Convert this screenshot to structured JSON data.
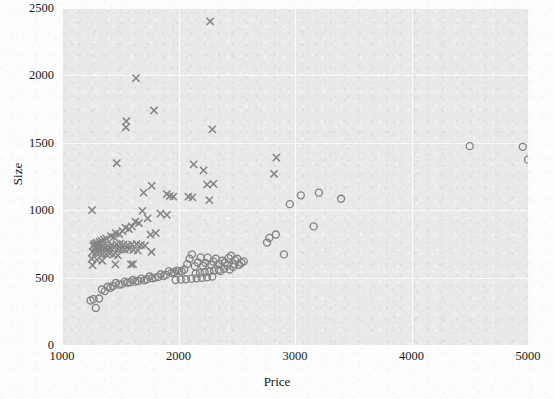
{
  "chart_data": {
    "type": "scatter",
    "title": "",
    "xlabel": "Price",
    "ylabel": "Size",
    "xlim": [
      1000,
      5000
    ],
    "ylim": [
      0,
      2500
    ],
    "xticks": [
      "1000",
      "2000",
      "3000",
      "4000",
      "5000"
    ],
    "yticks": [
      "0",
      "500",
      "1000",
      "1500",
      "2000",
      "2500"
    ],
    "grid": true,
    "legend": "none",
    "background_color": "#e9e9e9",
    "marker_color": "#838383",
    "series": [
      {
        "name": "cross-series",
        "marker": "x",
        "points": [
          [
            2272,
            2400
          ],
          [
            1635,
            1980
          ],
          [
            1790,
            1740
          ],
          [
            1552,
            1660
          ],
          [
            1548,
            1615
          ],
          [
            2290,
            1600
          ],
          [
            1470,
            1350
          ],
          [
            2130,
            1340
          ],
          [
            2215,
            1295
          ],
          [
            2840,
            1390
          ],
          [
            2820,
            1270
          ],
          [
            2300,
            1195
          ],
          [
            2245,
            1190
          ],
          [
            1770,
            1180
          ],
          [
            1700,
            1130
          ],
          [
            1900,
            1120
          ],
          [
            1925,
            1105
          ],
          [
            1955,
            1100
          ],
          [
            2085,
            1100
          ],
          [
            2120,
            1095
          ],
          [
            2265,
            1075
          ],
          [
            1258,
            1000
          ],
          [
            1690,
            995
          ],
          [
            1845,
            975
          ],
          [
            1900,
            965
          ],
          [
            1735,
            940
          ],
          [
            1630,
            915
          ],
          [
            1660,
            905
          ],
          [
            1600,
            880
          ],
          [
            1545,
            870
          ],
          [
            1575,
            860
          ],
          [
            1520,
            845
          ],
          [
            1462,
            830
          ],
          [
            1492,
            822
          ],
          [
            1420,
            808
          ],
          [
            1445,
            800
          ],
          [
            1380,
            790
          ],
          [
            1360,
            782
          ],
          [
            1805,
            830
          ],
          [
            1760,
            818
          ],
          [
            1340,
            772
          ],
          [
            1322,
            765
          ],
          [
            1300,
            758
          ],
          [
            1290,
            752
          ],
          [
            1275,
            748
          ],
          [
            1315,
            742
          ],
          [
            1352,
            738
          ],
          [
            1390,
            735
          ],
          [
            1425,
            742
          ],
          [
            1468,
            748
          ],
          [
            1500,
            752
          ],
          [
            1530,
            745
          ],
          [
            1565,
            740
          ],
          [
            1600,
            745
          ],
          [
            1640,
            748
          ],
          [
            1678,
            742
          ],
          [
            1712,
            738
          ],
          [
            1268,
            735
          ],
          [
            1285,
            728
          ],
          [
            1310,
            722
          ],
          [
            1335,
            718
          ],
          [
            1360,
            715
          ],
          [
            1390,
            712
          ],
          [
            1418,
            718
          ],
          [
            1448,
            722
          ],
          [
            1478,
            715
          ],
          [
            1508,
            710
          ],
          [
            1540,
            706
          ],
          [
            1575,
            712
          ],
          [
            1612,
            706
          ],
          [
            1650,
            700
          ],
          [
            1262,
            690
          ],
          [
            1290,
            685
          ],
          [
            1320,
            680
          ],
          [
            1348,
            676
          ],
          [
            1380,
            672
          ],
          [
            1410,
            678
          ],
          [
            1442,
            670
          ],
          [
            1480,
            665
          ],
          [
            1768,
            690
          ],
          [
            1255,
            640
          ],
          [
            1300,
            632
          ],
          [
            1345,
            625
          ],
          [
            1458,
            598
          ],
          [
            1610,
            600
          ],
          [
            1592,
            598
          ],
          [
            1262,
            592
          ]
        ]
      },
      {
        "name": "circle-series",
        "marker": "o",
        "points": [
          [
            4500,
            1475
          ],
          [
            4955,
            1470
          ],
          [
            5000,
            1375
          ],
          [
            3205,
            1130
          ],
          [
            3395,
            1085
          ],
          [
            3050,
            1110
          ],
          [
            2955,
            1045
          ],
          [
            3160,
            880
          ],
          [
            2905,
            672
          ],
          [
            2780,
            795
          ],
          [
            2835,
            820
          ],
          [
            2760,
            760
          ],
          [
            2485,
            630
          ],
          [
            2505,
            640
          ],
          [
            2450,
            662
          ],
          [
            2430,
            645
          ],
          [
            2478,
            600
          ],
          [
            2420,
            590
          ],
          [
            2398,
            612
          ],
          [
            2375,
            625
          ],
          [
            2350,
            600
          ],
          [
            2320,
            640
          ],
          [
            2300,
            618
          ],
          [
            2280,
            595
          ],
          [
            2250,
            648
          ],
          [
            2230,
            608
          ],
          [
            2210,
            588
          ],
          [
            2190,
            650
          ],
          [
            2165,
            612
          ],
          [
            2140,
            585
          ],
          [
            2115,
            672
          ],
          [
            2095,
            640
          ],
          [
            2075,
            600
          ],
          [
            2050,
            560
          ],
          [
            2028,
            545
          ],
          [
            2005,
            548
          ],
          [
            1985,
            552
          ],
          [
            1962,
            540
          ],
          [
            1940,
            535
          ],
          [
            1918,
            548
          ],
          [
            1895,
            520
          ],
          [
            1872,
            512
          ],
          [
            1848,
            525
          ],
          [
            1825,
            505
          ],
          [
            1800,
            500
          ],
          [
            1775,
            495
          ],
          [
            1752,
            508
          ],
          [
            1728,
            488
          ],
          [
            1705,
            480
          ],
          [
            1680,
            492
          ],
          [
            1655,
            475
          ],
          [
            1630,
            470
          ],
          [
            1608,
            482
          ],
          [
            1585,
            465
          ],
          [
            1560,
            462
          ],
          [
            1538,
            470
          ],
          [
            1512,
            450
          ],
          [
            1488,
            448
          ],
          [
            1462,
            460
          ],
          [
            1438,
            438
          ],
          [
            1415,
            425
          ],
          [
            1392,
            432
          ],
          [
            1368,
            400
          ],
          [
            1342,
            412
          ],
          [
            1318,
            345
          ],
          [
            1270,
            340
          ],
          [
            1245,
            330
          ],
          [
            1290,
            275
          ],
          [
            2520,
            595
          ],
          [
            2540,
            610
          ],
          [
            2470,
            580
          ],
          [
            2390,
            565
          ],
          [
            2345,
            558
          ],
          [
            2305,
            552
          ],
          [
            2265,
            545
          ],
          [
            2225,
            540
          ],
          [
            2185,
            535
          ],
          [
            2148,
            530
          ],
          [
            2560,
            620
          ],
          [
            2440,
            560
          ],
          [
            2360,
            548
          ],
          [
            2290,
            508
          ],
          [
            2245,
            502
          ],
          [
            2200,
            498
          ],
          [
            2155,
            495
          ],
          [
            2110,
            492
          ],
          [
            2065,
            488
          ],
          [
            2020,
            485
          ],
          [
            1975,
            482
          ]
        ]
      }
    ]
  },
  "axes": {
    "x": {
      "label": "Price",
      "ticks": [
        {
          "value": 1000,
          "label": "1000"
        },
        {
          "value": 2000,
          "label": "2000"
        },
        {
          "value": 3000,
          "label": "3000"
        },
        {
          "value": 4000,
          "label": "4000"
        },
        {
          "value": 5000,
          "label": "5000"
        }
      ]
    },
    "y": {
      "label": "Size",
      "ticks": [
        {
          "value": 0,
          "label": "0"
        },
        {
          "value": 500,
          "label": "500"
        },
        {
          "value": 1000,
          "label": "1000"
        },
        {
          "value": 1500,
          "label": "1500"
        },
        {
          "value": 2000,
          "label": "2000"
        },
        {
          "value": 2500,
          "label": "2500"
        }
      ]
    }
  }
}
